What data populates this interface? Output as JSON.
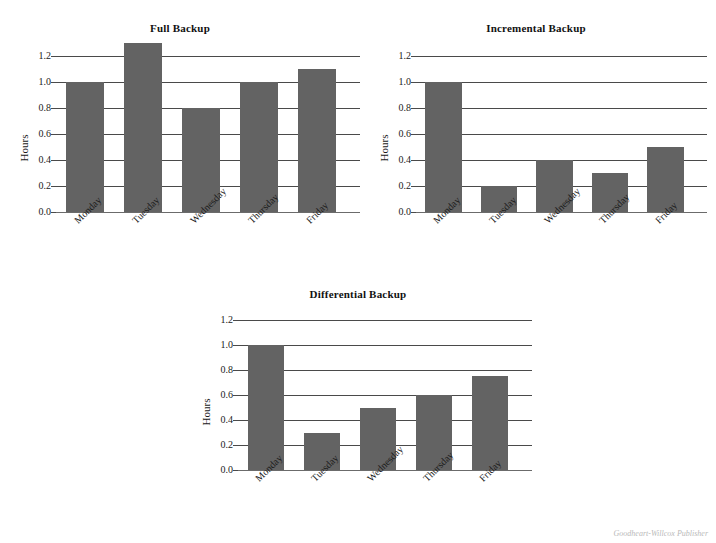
{
  "page": {
    "background": "#ffffff",
    "credit": "Goodheart-Willcox Publisher",
    "bar_color": "#636363",
    "gridline_color": "#4a4a4a",
    "text_color": "#1a1a1a"
  },
  "chart_data": [
    {
      "type": "bar",
      "title": "Full Backup",
      "xlabel": "",
      "ylabel": "Hours",
      "categories": [
        "Monday",
        "Tuesday",
        "Wednesday",
        "Thursday",
        "Friday"
      ],
      "values": [
        1.0,
        1.3,
        0.8,
        1.0,
        1.1
      ],
      "ylim": [
        0.0,
        1.2
      ],
      "yticks": [
        0.0,
        0.2,
        0.4,
        0.6,
        0.8,
        1.0,
        1.2
      ],
      "ytick_labels": [
        "0.0",
        "0.2",
        "0.4",
        "0.6",
        "0.8",
        "1.0",
        "1.2"
      ],
      "grid": true,
      "legend": "none",
      "bar_color": "#636363"
    },
    {
      "type": "bar",
      "title": "Incremental Backup",
      "xlabel": "",
      "ylabel": "Hours",
      "categories": [
        "Monday",
        "Tuesday",
        "Wednesday",
        "Thursday",
        "Friday"
      ],
      "values": [
        1.0,
        0.2,
        0.4,
        0.3,
        0.5
      ],
      "ylim": [
        0.0,
        1.2
      ],
      "yticks": [
        0.0,
        0.2,
        0.4,
        0.6,
        0.8,
        1.0,
        1.2
      ],
      "ytick_labels": [
        "0.0",
        "0.2",
        "0.4",
        "0.6",
        "0.8",
        "1.0",
        "1.2"
      ],
      "grid": true,
      "legend": "none",
      "bar_color": "#636363"
    },
    {
      "type": "bar",
      "title": "Differential Backup",
      "xlabel": "",
      "ylabel": "Hours",
      "categories": [
        "Monday",
        "Tuesday",
        "Wednesday",
        "Thursday",
        "Friday"
      ],
      "values": [
        1.0,
        0.3,
        0.5,
        0.6,
        0.75
      ],
      "ylim": [
        0.0,
        1.2
      ],
      "yticks": [
        0.0,
        0.2,
        0.4,
        0.6,
        0.8,
        1.0,
        1.2
      ],
      "ytick_labels": [
        "0.0",
        "0.2",
        "0.4",
        "0.6",
        "0.8",
        "1.0",
        "1.2"
      ],
      "grid": true,
      "legend": "none",
      "bar_color": "#636363"
    }
  ]
}
